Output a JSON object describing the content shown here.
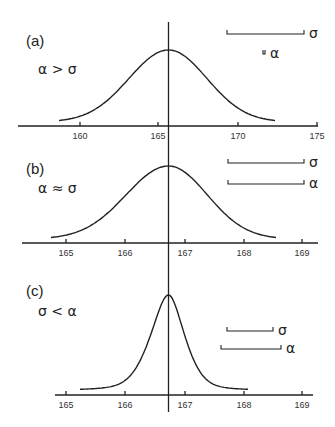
{
  "figure": {
    "vertical_line": {
      "x": 168.5,
      "y1": 22,
      "y2": 412
    }
  },
  "chart_data": [
    {
      "type": "line",
      "title": "",
      "panel_label": "(a)",
      "condition_label": "α > σ",
      "note": "Label text reads 'α > σ' while the drawn α scale bar is much shorter than the σ bar; both reproduced as shown.",
      "xlabel": "",
      "ylabel": "",
      "x_ticks": [
        160,
        165,
        170,
        175
      ],
      "xlim": [
        156,
        175
      ],
      "grid": false,
      "series": [
        {
          "name": "distribution",
          "shape": "gaussian",
          "center": 165.6,
          "sd_approx": 2.6,
          "x_range": [
            158.8,
            172.5
          ]
        }
      ],
      "scale_bars": [
        {
          "symbol": "σ",
          "x1": 227,
          "x2": 304,
          "y": 34
        },
        {
          "symbol": "α",
          "x1": 263,
          "x2": 265,
          "y": 54
        }
      ],
      "layout": {
        "axis_y": 126,
        "axis_x1": 18,
        "axis_x2": 318,
        "tick_px": {
          "160": 80,
          "165": 158,
          "170": 238,
          "175": 317
        },
        "peak_y": 50,
        "curve_x1": 59,
        "curve_x2": 275,
        "label_pos": {
          "x": 26,
          "y": 46
        },
        "cond_pos": {
          "x": 38,
          "y": 74
        }
      }
    },
    {
      "type": "line",
      "title": "",
      "panel_label": "(b)",
      "condition_label": "α ≈ σ",
      "xlabel": "",
      "ylabel": "",
      "x_ticks": [
        165,
        166,
        167,
        168,
        169
      ],
      "xlim": [
        164.6,
        169.2
      ],
      "grid": false,
      "series": [
        {
          "name": "distribution",
          "shape": "gaussian",
          "center": 166.73,
          "sd_approx": 0.45,
          "x_range": [
            164.8,
            168.6
          ]
        }
      ],
      "scale_bars": [
        {
          "symbol": "σ",
          "x1": 228,
          "x2": 304,
          "y": 163
        },
        {
          "symbol": "α",
          "x1": 228,
          "x2": 304,
          "y": 184
        }
      ],
      "layout": {
        "axis_y": 243,
        "axis_x1": 22,
        "axis_x2": 318,
        "tick_px": {
          "165": 66,
          "166": 125,
          "167": 185,
          "168": 244,
          "169": 302
        },
        "peak_y": 166,
        "curve_x1": 51,
        "curve_x2": 276,
        "label_pos": {
          "x": 26,
          "y": 174
        },
        "cond_pos": {
          "x": 38,
          "y": 193
        }
      }
    },
    {
      "type": "line",
      "title": "",
      "panel_label": "(c)",
      "condition_label": "σ < α",
      "xlabel": "",
      "ylabel": "",
      "x_ticks": [
        165,
        166,
        167,
        168,
        169
      ],
      "xlim": [
        164.8,
        169.2
      ],
      "grid": false,
      "series": [
        {
          "name": "distribution",
          "shape": "peaked (narrow)",
          "center": 166.73,
          "sd_approx": 0.2,
          "x_range": [
            165.3,
            168.1
          ]
        }
      ],
      "scale_bars": [
        {
          "symbol": "σ",
          "x1": 227,
          "x2": 273,
          "y": 331
        },
        {
          "symbol": "α",
          "x1": 221,
          "x2": 281,
          "y": 349
        }
      ],
      "layout": {
        "axis_y": 395,
        "axis_x1": 55,
        "axis_x2": 313,
        "tick_px": {
          "165": 66,
          "166": 125,
          "167": 185,
          "168": 244,
          "169": 302
        },
        "peak_y": 295,
        "curve_x1": 80,
        "curve_x2": 248,
        "label_pos": {
          "x": 26,
          "y": 296
        },
        "cond_pos": {
          "x": 38,
          "y": 316
        }
      }
    }
  ]
}
